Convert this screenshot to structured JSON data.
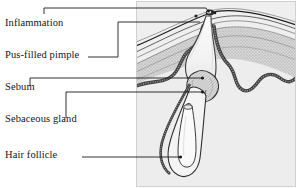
{
  "figure": {
    "kind": "anatomical-cross-section",
    "background_color": "#ffffff",
    "illustration_tint": "#ececec",
    "line_color": "#1a1a1a",
    "border_color": "#b9b9b9"
  },
  "labels": [
    {
      "id": "inflammation",
      "text": "Inflammation"
    },
    {
      "id": "pus-filled-pimple",
      "text": "Pus-filled pimple"
    },
    {
      "id": "sebum",
      "text": "Sebum"
    },
    {
      "id": "sebaceous-gland",
      "text": "Sebaceous gland"
    },
    {
      "id": "hair-follicle",
      "text": "Hair follicle"
    }
  ],
  "leader_lines": [
    {
      "id": "leader-inflammation",
      "from_label": "Inflammation",
      "endpoint_marker": "dot"
    },
    {
      "id": "leader-pus-filled-pimple",
      "from_label": "Pus-filled pimple",
      "endpoint_marker": "none"
    },
    {
      "id": "leader-sebum",
      "from_label": "Sebum",
      "endpoint_marker": "dot"
    },
    {
      "id": "leader-sebaceous-gland",
      "from_label": "Sebaceous gland",
      "endpoint_marker": "dot"
    },
    {
      "id": "leader-hair-follicle",
      "from_label": "Hair follicle",
      "endpoint_marker": "dot"
    }
  ],
  "illustration_parts": [
    {
      "id": "epidermis-layers",
      "name": "Epidermis layers"
    },
    {
      "id": "dermis-field",
      "name": "Dermis"
    },
    {
      "id": "pustule",
      "name": "Pus-filled pimple cavity"
    },
    {
      "id": "inflamed-surface",
      "name": "Inflamed skin surface"
    },
    {
      "id": "sebaceous-gland",
      "name": "Sebaceous gland"
    },
    {
      "id": "follicle-wall",
      "name": "Hair follicle wall"
    },
    {
      "id": "hair-shaft",
      "name": "Hair shaft"
    },
    {
      "id": "follicle-bulb",
      "name": "Hair follicle bulb"
    }
  ]
}
